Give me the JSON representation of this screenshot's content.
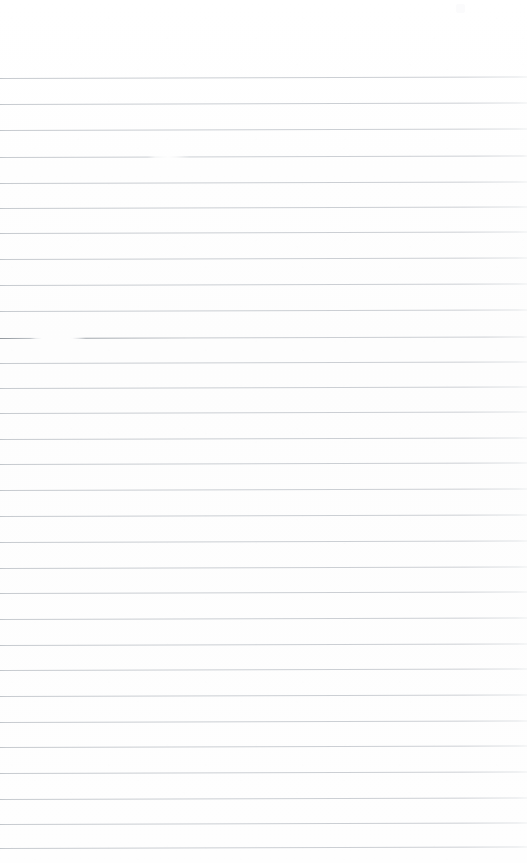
{
  "document": {
    "kind": "scanned-ruled-paper",
    "description": "Blank scanned sheet of lined notebook paper",
    "width": 527,
    "height": 863,
    "has_text_content": false,
    "text_content": "",
    "orientation": "portrait"
  },
  "colors": {
    "page_background": "#fefefe",
    "rule_line": "#c8ccd1",
    "rule_line_dark_artifact": "#8d9399",
    "rule_line_faded_end": "#eef0f1"
  },
  "ruling": {
    "style": "wide-ruled",
    "line_count": 31,
    "first_line_y": 78,
    "last_line_y": 848,
    "line_spacing": 25.7,
    "line_thickness": 1,
    "top_margin": 78,
    "bottom_margin": 15,
    "left_inset": 0,
    "right_inset": 0,
    "skew_degrees": -0.16,
    "lines": [
      {
        "index": 1,
        "y": 78,
        "variant": "plain"
      },
      {
        "index": 2,
        "y": 104,
        "variant": "plain"
      },
      {
        "index": 3,
        "y": 130,
        "variant": "plain"
      },
      {
        "index": 4,
        "y": 157,
        "variant": "break-mid"
      },
      {
        "index": 5,
        "y": 183,
        "variant": "plain"
      },
      {
        "index": 6,
        "y": 208,
        "variant": "plain"
      },
      {
        "index": 7,
        "y": 233,
        "variant": "plain"
      },
      {
        "index": 8,
        "y": 259,
        "variant": "plain"
      },
      {
        "index": 9,
        "y": 285,
        "variant": "plain"
      },
      {
        "index": 10,
        "y": 311,
        "variant": "plain"
      },
      {
        "index": 11,
        "y": 338,
        "variant": "break-left"
      },
      {
        "index": 12,
        "y": 363,
        "variant": "plain"
      },
      {
        "index": 13,
        "y": 388,
        "variant": "plain"
      },
      {
        "index": 14,
        "y": 413,
        "variant": "plain"
      },
      {
        "index": 15,
        "y": 439,
        "variant": "plain"
      },
      {
        "index": 16,
        "y": 464,
        "variant": "plain"
      },
      {
        "index": 17,
        "y": 490,
        "variant": "plain"
      },
      {
        "index": 18,
        "y": 516,
        "variant": "plain"
      },
      {
        "index": 19,
        "y": 542,
        "variant": "plain"
      },
      {
        "index": 20,
        "y": 568,
        "variant": "plain"
      },
      {
        "index": 21,
        "y": 593,
        "variant": "plain"
      },
      {
        "index": 22,
        "y": 619,
        "variant": "plain"
      },
      {
        "index": 23,
        "y": 645,
        "variant": "plain"
      },
      {
        "index": 24,
        "y": 670,
        "variant": "plain"
      },
      {
        "index": 25,
        "y": 696,
        "variant": "plain"
      },
      {
        "index": 26,
        "y": 722,
        "variant": "plain"
      },
      {
        "index": 27,
        "y": 747,
        "variant": "plain"
      },
      {
        "index": 28,
        "y": 773,
        "variant": "plain"
      },
      {
        "index": 29,
        "y": 799,
        "variant": "plain"
      },
      {
        "index": 30,
        "y": 824,
        "variant": "plain"
      },
      {
        "index": 31,
        "y": 848,
        "variant": "plain"
      }
    ]
  },
  "artifacts": [
    {
      "name": "line-dropout",
      "description": "Faint break in rule line",
      "line_index": 4,
      "x": 155,
      "y": 157,
      "width": 22
    },
    {
      "name": "line-stub-and-gap",
      "description": "Darker stub at left edge followed by a white gap before the line resumes",
      "line_index": 11,
      "x": 0,
      "y": 338,
      "width": 86
    },
    {
      "name": "scanner-speck",
      "description": "Faint off-white speck near top-right corner",
      "x": 456,
      "y": 4,
      "width": 9,
      "height": 9
    }
  ]
}
